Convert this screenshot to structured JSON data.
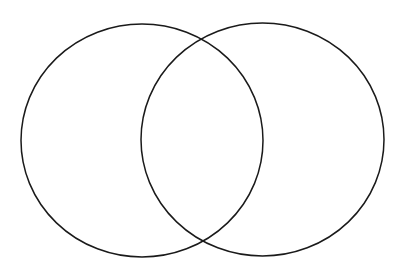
{
  "diagram": {
    "type": "venn",
    "sets": [
      {
        "id": "left",
        "cx": 142,
        "cy": 140.5,
        "rx": 121,
        "ry": 116.5
      },
      {
        "id": "right",
        "cx": 262.5,
        "cy": 139.5,
        "rx": 121.5,
        "ry": 116.5
      }
    ],
    "stroke_color": "#1a1a1a",
    "background": "#ffffff"
  }
}
